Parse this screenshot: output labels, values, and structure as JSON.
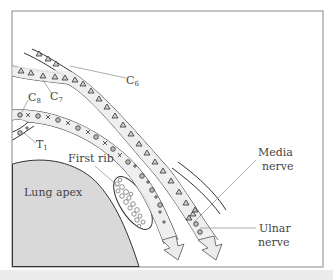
{
  "figure": {
    "frame": {
      "x": 12,
      "y": 11,
      "width": 311,
      "height": 256,
      "stroke": "#888888"
    },
    "colors": {
      "lung_fill": "#d9d9d9",
      "nerve_fill": "#ededed",
      "outline": "#333333",
      "leader_line": "#8a8a8a",
      "text": "#444444",
      "bottom_band": "#ececec"
    },
    "labels": {
      "c6": {
        "base": "C",
        "sub": "6"
      },
      "c7": {
        "base": "C",
        "sub": "7"
      },
      "c8": {
        "base": "C",
        "sub": "8"
      },
      "t1": {
        "base": "T",
        "sub": "1"
      },
      "first_rib": "First rib",
      "lung_apex": "Lung apex",
      "median_nerve_line1": "Media",
      "median_nerve_line2": "nerve",
      "ulnar_nerve_line1": "Ulnar",
      "ulnar_nerve_line2": "nerve"
    },
    "legend_symbols": {
      "triangle": "C6/C7 fibres",
      "circle": "C8 fibres",
      "cross": "T1 fibres"
    }
  }
}
